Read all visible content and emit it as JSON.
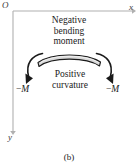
{
  "figure": {
    "caption": "(b)",
    "background_color": "#ffffff"
  },
  "axes": {
    "origin_label": "O",
    "x_label": "x",
    "y_label": "y",
    "color": "#b0b0b0"
  },
  "annotations": {
    "moment_text_line1": "Negative",
    "moment_text_line2": "bending",
    "moment_text_line3": "moment",
    "curvature_text_line1": "Positive",
    "curvature_text_line2": "curvature",
    "moment_left_sign": "−",
    "moment_left_symbol": "M",
    "moment_right_sign": "−",
    "moment_right_symbol": "M"
  },
  "beam": {
    "fill_color": "#d9d9d9",
    "outline_color": "#1a1a1a"
  },
  "arrows": {
    "color": "#1a1a1a"
  }
}
